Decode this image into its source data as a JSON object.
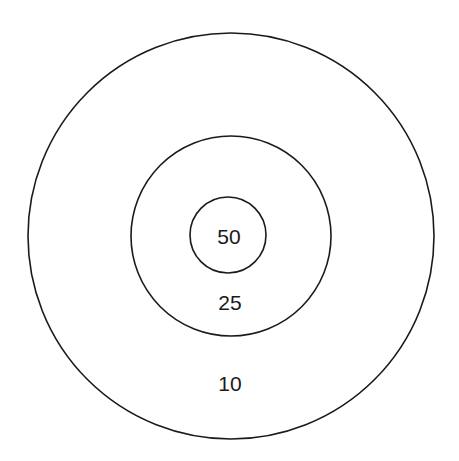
{
  "diagram": {
    "type": "target",
    "rings": [
      {
        "name": "outer",
        "score": "10"
      },
      {
        "name": "middle",
        "score": "25"
      },
      {
        "name": "inner",
        "score": "50"
      }
    ]
  }
}
